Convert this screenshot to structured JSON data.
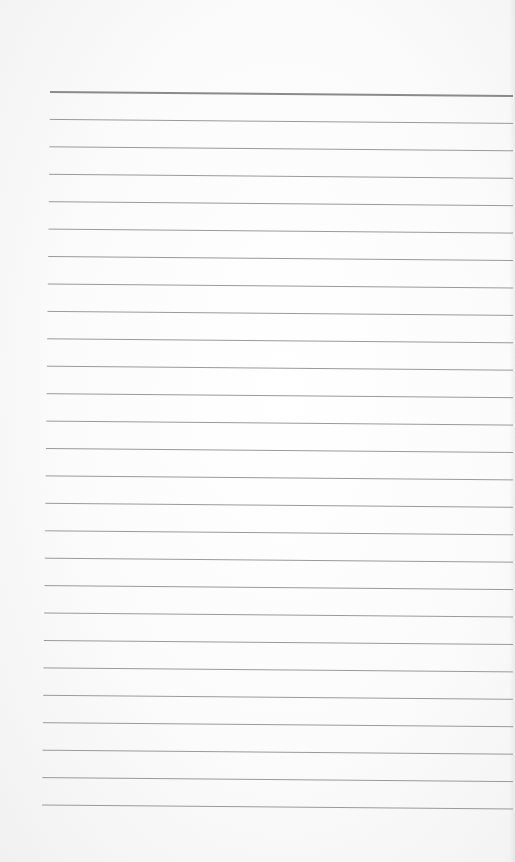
{
  "page": {
    "type": "ruled-paper",
    "background_color": "#fbfbfb",
    "line_color": "#9a9a9a",
    "header_line_color": "#8a8a8a",
    "line_count": 27,
    "first_line_y": 92,
    "last_line_y": 805,
    "text": []
  }
}
